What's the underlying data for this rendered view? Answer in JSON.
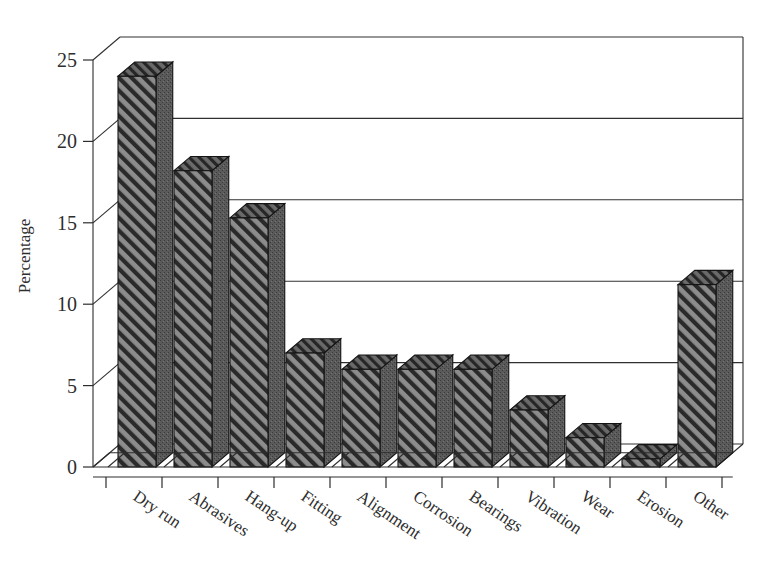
{
  "chart_data": {
    "type": "bar",
    "title": "",
    "xlabel": "",
    "ylabel": "Percentage",
    "ylim": [
      0,
      25
    ],
    "yticks": [
      0,
      5,
      10,
      15,
      20,
      25
    ],
    "ytick_labels": [
      "0",
      "5",
      "10",
      "15",
      "20",
      "25"
    ],
    "grid": true,
    "grid_axis": "y",
    "legend": false,
    "style": "3d-bars-hatched",
    "categories": [
      "Dry run",
      "Abrasives",
      "Hang-up",
      "Fitting",
      "Alignment",
      "Corrosion",
      "Bearings",
      "Vibration",
      "Wear",
      "Erosion",
      "Other"
    ],
    "values": [
      24.0,
      18.2,
      15.3,
      7.0,
      6.0,
      6.0,
      6.0,
      3.5,
      1.8,
      0.5,
      11.2
    ],
    "bar_fill": "#6e6e6e",
    "bar_top_fill": "#4a4a4a",
    "bar_side_fill": "#565656",
    "axis_color": "#2d2d2d",
    "background": "#ffffff"
  },
  "axis": {
    "y_title": "Percentage"
  }
}
